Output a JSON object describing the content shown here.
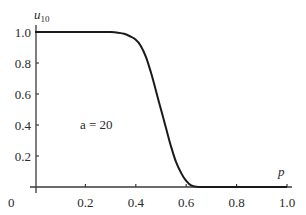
{
  "chart_data": {
    "type": "line",
    "title": "",
    "xlabel": "p",
    "ylabel": "u",
    "ylabel_subscript": "10",
    "xlim": [
      0,
      1.0
    ],
    "ylim": [
      0,
      1.0
    ],
    "grid": false,
    "legend": null,
    "x_ticks": [
      "0",
      "0.2",
      "0.4",
      "0.6",
      "0.8",
      "1.0"
    ],
    "y_ticks": [
      "0.2",
      "0.4",
      "0.6",
      "0.8",
      "1.0"
    ],
    "annotations": [
      {
        "text": "a = 20",
        "x": 0.2,
        "y": 0.4
      }
    ],
    "series": [
      {
        "name": "u10",
        "x": [
          0.0,
          0.05,
          0.1,
          0.15,
          0.2,
          0.25,
          0.3,
          0.35,
          0.38,
          0.4,
          0.42,
          0.44,
          0.46,
          0.48,
          0.5,
          0.52,
          0.54,
          0.56,
          0.58,
          0.6,
          0.62,
          0.65,
          0.7,
          0.8,
          0.9,
          1.0
        ],
        "y": [
          1.0,
          1.0,
          1.0,
          1.0,
          1.0,
          1.0,
          1.0,
          0.99,
          0.97,
          0.95,
          0.91,
          0.84,
          0.74,
          0.62,
          0.5,
          0.38,
          0.26,
          0.16,
          0.09,
          0.04,
          0.01,
          0.0,
          0.0,
          0.0,
          0.0,
          0.0
        ]
      }
    ]
  }
}
